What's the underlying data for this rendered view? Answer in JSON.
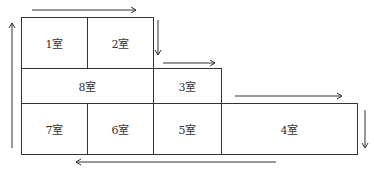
{
  "diagram": {
    "rooms": [
      {
        "id": "1",
        "label": "1室"
      },
      {
        "id": "2",
        "label": "2室"
      },
      {
        "id": "8",
        "label": "8室"
      },
      {
        "id": "3",
        "label": "3室"
      },
      {
        "id": "7",
        "label": "7室"
      },
      {
        "id": "6",
        "label": "6室"
      },
      {
        "id": "5",
        "label": "5室"
      },
      {
        "id": "4",
        "label": "4室"
      }
    ],
    "arrows": [
      {
        "direction": "right",
        "position": "above rooms 1-2"
      },
      {
        "direction": "down",
        "position": "right of room 2"
      },
      {
        "direction": "right",
        "position": "above room 3"
      },
      {
        "direction": "right",
        "position": "above room 4"
      },
      {
        "direction": "down",
        "position": "right of room 4"
      },
      {
        "direction": "left",
        "position": "below rooms 6-4"
      },
      {
        "direction": "up",
        "position": "left of rooms 7-1"
      }
    ],
    "stroke_color": "#333333"
  }
}
